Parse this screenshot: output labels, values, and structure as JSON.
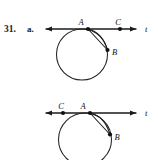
{
  "problem": {
    "number": "31.",
    "part": "a."
  },
  "figures": [
    {
      "id": "figure-top",
      "axis_label": "t",
      "line": {
        "y": 29,
        "x_start": 44,
        "x_end": 138,
        "arrow_left": true,
        "arrow_right": true
      },
      "circle": {
        "cx": 82,
        "cy": 54.5,
        "r": 25.5
      },
      "points": [
        {
          "name": "A",
          "label": "A",
          "x": 88,
          "y": 29,
          "label_dx": -7,
          "label_dy": -4
        },
        {
          "name": "B",
          "label": "B",
          "x": 107.5,
          "y": 50,
          "label_dx": 4,
          "label_dy": 4.5
        },
        {
          "name": "C",
          "label": "C",
          "x": 120,
          "y": 29,
          "label_dx": -2.5,
          "label_dy": -4
        }
      ],
      "chord": {
        "from": "A",
        "to": "B"
      },
      "arc": {
        "from": "A",
        "to": "B",
        "bulge": "outward"
      }
    },
    {
      "id": "figure-bottom",
      "axis_label": "t",
      "line": {
        "y": 113,
        "x_start": 44,
        "x_end": 138,
        "arrow_left": true,
        "arrow_right": true
      },
      "circle": {
        "cx": 85,
        "cy": 139.5,
        "r": 26.5
      },
      "points": [
        {
          "name": "A",
          "label": "A",
          "x": 90,
          "y": 113,
          "label_dx": -7,
          "label_dy": -4
        },
        {
          "name": "B",
          "label": "B",
          "x": 110,
          "y": 134.5,
          "label_dx": 4,
          "label_dy": 4.5
        },
        {
          "name": "C",
          "label": "C",
          "x": 63,
          "y": 113,
          "label_dx": -2.5,
          "label_dy": -4
        }
      ],
      "chord": {
        "from": "A",
        "to": "B"
      },
      "arc": {
        "from": "A",
        "to": "B",
        "bulge": "outward"
      }
    }
  ],
  "colors": {
    "ink": "#1a1a1a",
    "paper": "#ffffff",
    "curve": "#222222"
  }
}
